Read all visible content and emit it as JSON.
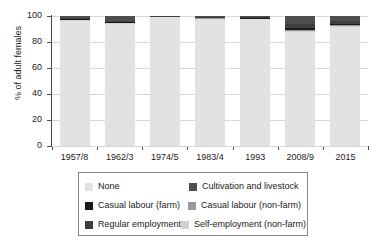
{
  "chart_data": {
    "type": "bar",
    "subtype": "stacked-bar-100",
    "title": "",
    "xlabel": "",
    "ylabel": "% of adult females",
    "ylim": [
      0,
      100
    ],
    "yticks": [
      0,
      20,
      40,
      60,
      80,
      100
    ],
    "grid": true,
    "legend_position": "below",
    "categories": [
      "1957/8",
      "1962/3",
      "1974/5",
      "1983/4",
      "1993",
      "2008/9",
      "2015"
    ],
    "series": [
      {
        "name": "None",
        "color": "#e2e2e2",
        "values": [
          97.0,
          94.5,
          99.7,
          98.3,
          97.8,
          87.5,
          92.0
        ]
      },
      {
        "name": "Self-employment (non-farm)",
        "color": "#d0d0d0",
        "values": [
          0.3,
          0.4,
          0.1,
          0.2,
          0.3,
          1.0,
          0.6
        ]
      },
      {
        "name": "Casual labour (non-farm)",
        "color": "#9a9a9a",
        "values": [
          0.2,
          0.3,
          0.1,
          0.2,
          0.2,
          0.8,
          0.5
        ]
      },
      {
        "name": "Casual labour (farm)",
        "color": "#1a1a1a",
        "values": [
          0.5,
          0.3,
          0.0,
          0.3,
          0.2,
          1.2,
          0.4
        ]
      },
      {
        "name": "Regular employment",
        "color": "#3f3f3f",
        "values": [
          0.6,
          0.5,
          0.1,
          0.4,
          0.4,
          3.5,
          3.0
        ]
      },
      {
        "name": "Cultivation and livestock",
        "color": "#4e4e4e",
        "values": [
          1.4,
          4.0,
          0.0,
          0.6,
          1.1,
          6.0,
          3.5
        ]
      }
    ]
  },
  "axis": {
    "y_title": "% of adult females",
    "y_tick_labels": [
      "0",
      "20",
      "40",
      "60",
      "80",
      "100"
    ],
    "x_tick_labels": [
      "1957/8",
      "1962/3",
      "1974/5",
      "1983/4",
      "1993",
      "2008/9",
      "2015"
    ]
  },
  "legend": {
    "rows": [
      {
        "left": {
          "label": "None",
          "color": "#e2e2e2"
        },
        "right": {
          "label": "Cultivation and livestock",
          "color": "#4e4e4e"
        }
      },
      {
        "left": {
          "label": "Casual labour (farm)",
          "color": "#1a1a1a"
        },
        "right": {
          "label": "Casual labour (non-farm)",
          "color": "#9a9a9a"
        }
      },
      {
        "left": {
          "label": "Regular employment",
          "color": "#3f3f3f"
        },
        "right": {
          "label": "Self-employment (non-farm)",
          "color": "#d0d0d0"
        }
      }
    ]
  },
  "colors": {
    "axis": "#4a4a4a",
    "grid": "#d8d8d8",
    "text": "#1a1a1a",
    "legend_border": "#8a8a8a",
    "background": "#ffffff"
  }
}
